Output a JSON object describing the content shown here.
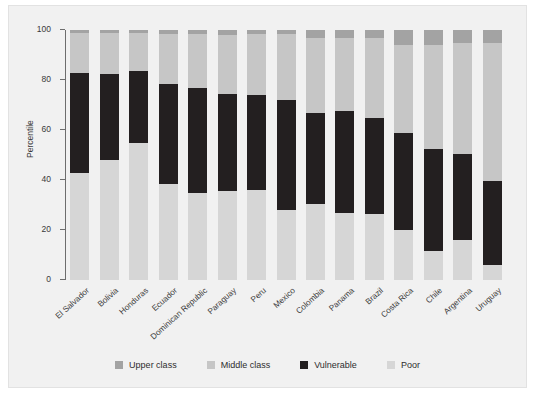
{
  "chart_data": {
    "type": "bar",
    "stacked": true,
    "title": "",
    "xlabel": "",
    "ylabel": "Percentile",
    "ylim": [
      0,
      100
    ],
    "yticks": [
      0,
      20,
      40,
      60,
      80,
      100
    ],
    "ytick_labels": [
      "0",
      "20",
      "40",
      "60",
      "80",
      "100"
    ],
    "grid": false,
    "legend_position": "bottom",
    "categories": [
      "El Salvador",
      "Bolivia",
      "Honduras",
      "Ecuador",
      "Dominican Republic",
      "Paraguay",
      "Peru",
      "Mexico",
      "Colombia",
      "Panama",
      "Brazil",
      "Costa Rica",
      "Chile",
      "Argentina",
      "Uruguay"
    ],
    "series": [
      {
        "name": "Poor",
        "color": "#d6d6d6",
        "values": [
          43.0,
          48.0,
          55.0,
          38.5,
          35.0,
          35.5,
          36.0,
          28.0,
          30.5,
          27.0,
          26.5,
          20.0,
          11.5,
          16.0,
          6.0
        ]
      },
      {
        "name": "Vulnerable",
        "color": "#231f20",
        "values": [
          40.0,
          34.5,
          28.5,
          40.0,
          42.0,
          39.0,
          38.0,
          44.0,
          36.5,
          40.5,
          38.5,
          39.0,
          41.0,
          34.5,
          33.5
        ]
      },
      {
        "name": "Middle class",
        "color": "#c6c6c6",
        "values": [
          16.0,
          16.5,
          15.5,
          20.0,
          21.5,
          23.5,
          24.5,
          26.5,
          30.0,
          29.5,
          32.0,
          35.0,
          41.5,
          44.5,
          55.5
        ]
      },
      {
        "name": "Upper class",
        "color": "#a3a3a3",
        "values": [
          1.0,
          1.0,
          1.0,
          1.5,
          1.5,
          2.0,
          1.5,
          1.5,
          3.0,
          3.0,
          3.0,
          6.0,
          6.0,
          5.0,
          5.0
        ]
      }
    ],
    "legend": [
      {
        "label": "Upper class",
        "color": "#a3a3a3"
      },
      {
        "label": "Middle class",
        "color": "#c6c6c6"
      },
      {
        "label": "Vulnerable",
        "color": "#231f20"
      },
      {
        "label": "Poor",
        "color": "#d6d6d6"
      }
    ]
  }
}
